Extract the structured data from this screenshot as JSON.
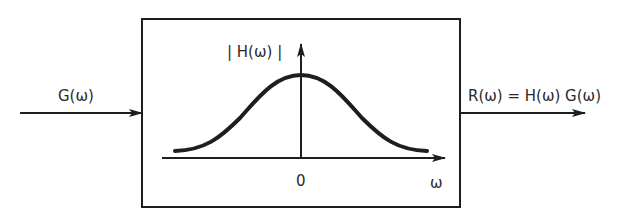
{
  "diagram": {
    "type": "block-diagram",
    "input": {
      "label": "G(ω)"
    },
    "system_block": {
      "plot": {
        "y_axis_label": "| H(ω) |",
        "x_axis_label": "ω",
        "origin_tick_label": "0",
        "curve_shape": "bell (Gaussian-like), symmetric about ω = 0"
      }
    },
    "output": {
      "label": "R(ω) = H(ω) G(ω)"
    },
    "colors": {
      "stroke": "#1e1e1e",
      "background": "#ffffff"
    }
  }
}
